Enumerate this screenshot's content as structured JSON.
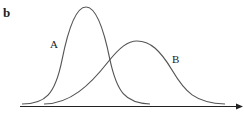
{
  "panel_label": "b",
  "curves": [
    {
      "label": "A",
      "description": "narrow tall distribution, peak left"
    },
    {
      "label": "B",
      "description": "wide shorter distribution, peak right"
    }
  ],
  "colors": {
    "stroke": "#555555",
    "axis": "#222222"
  }
}
